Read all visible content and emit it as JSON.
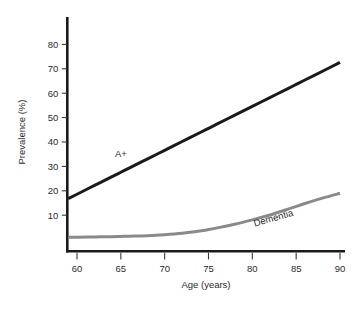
{
  "chart_data": {
    "type": "line",
    "title": "",
    "subtitle": "",
    "xlabel": "Age (years)",
    "ylabel": "Prevalence (%)",
    "xlim": [
      59,
      90
    ],
    "ylim": [
      0,
      85
    ],
    "xticks": [
      60,
      65,
      70,
      75,
      80,
      85,
      90
    ],
    "xtick_labels": [
      "60",
      "65",
      "70",
      "75",
      "80",
      "85",
      "90"
    ],
    "yticks": [
      10,
      20,
      30,
      40,
      50,
      60,
      70,
      80
    ],
    "ytick_labels": [
      "10",
      "20",
      "30",
      "40",
      "50",
      "60",
      "70",
      "80"
    ],
    "grid": false,
    "legend_position": "inline-annotation",
    "x": [
      59,
      60,
      62,
      64,
      65,
      66,
      68,
      70,
      72,
      74,
      75,
      76,
      78,
      80,
      82,
      84,
      85,
      86,
      88,
      90
    ],
    "series": [
      {
        "name": "A+",
        "color": "#1a1a1a",
        "line_width": 3.0,
        "label_text": "A+",
        "label_x": 65,
        "label_y": 34,
        "label_rotation": 0,
        "values": [
          16.8,
          18.6,
          22.2,
          25.8,
          27.6,
          29.4,
          33.0,
          36.6,
          40.2,
          43.8,
          45.6,
          47.4,
          51.0,
          54.6,
          58.2,
          61.8,
          63.6,
          65.4,
          69.0,
          72.6
        ]
      },
      {
        "name": "Dementia",
        "color": "#8a8a8a",
        "line_width": 3.0,
        "label_text": "Dementia",
        "label_x": 82.5,
        "label_y": 7.6,
        "label_rotation": -16,
        "values": [
          1.0,
          1.0,
          1.1,
          1.2,
          1.3,
          1.4,
          1.6,
          2.0,
          2.6,
          3.5,
          4.1,
          4.8,
          6.3,
          8.1,
          10.1,
          12.4,
          13.6,
          14.8,
          17.0,
          19.0
        ]
      }
    ]
  }
}
